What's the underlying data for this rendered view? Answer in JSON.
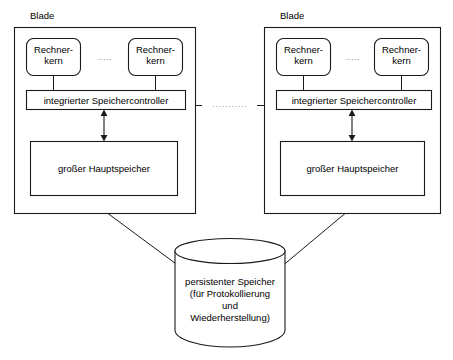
{
  "diagram": {
    "title_text": "Blade",
    "blades": [
      {
        "name": "Blade",
        "cores": [
          {
            "label": "Rechner-\nkern"
          },
          {
            "label": "Rechner-\nkern"
          }
        ],
        "core_ellipsis": ".....",
        "controller": {
          "label": "integrierter Speichercontroller"
        },
        "memory": {
          "label": "großer Hauptspeicher"
        }
      },
      {
        "name": "Blade",
        "cores": [
          {
            "label": "Rechner-\nkern"
          },
          {
            "label": "Rechner-\nkern"
          }
        ],
        "core_ellipsis": ".....",
        "controller": {
          "label": "integrierter Speichercontroller"
        },
        "memory": {
          "label": "großer Hauptspeicher"
        }
      }
    ],
    "inter_blade_ellipsis": "...........",
    "storage": {
      "label": "persistenter Speicher\n(für Protokollierung\nund\nWiederherstellung)"
    },
    "colors": {
      "stroke": "#1a1a1a",
      "background": "#ffffff",
      "text": "#000000",
      "ellipsis": "#666666"
    }
  }
}
